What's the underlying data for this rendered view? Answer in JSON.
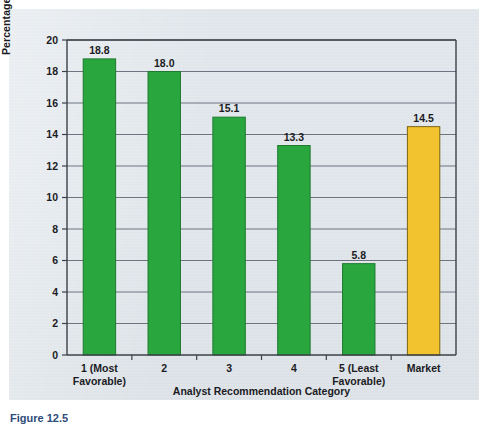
{
  "figure": {
    "caption": "Figure 12.5"
  },
  "chart_data": {
    "type": "bar",
    "title": "",
    "xlabel": "Analyst Recommendation Category",
    "ylabel": "Percentage Return",
    "categories": [
      "1 (Most\nFavorable)",
      "2",
      "3",
      "4",
      "5 (Least\nFavorable)",
      "Market"
    ],
    "category_lines": [
      [
        "1 (Most",
        "Favorable)"
      ],
      [
        "2",
        ""
      ],
      [
        "3",
        ""
      ],
      [
        "4",
        ""
      ],
      [
        "5 (Least",
        "Favorable)"
      ],
      [
        "Market",
        ""
      ]
    ],
    "values": [
      18.8,
      18.0,
      15.1,
      13.3,
      5.8,
      14.5
    ],
    "value_labels": [
      "18.8",
      "18.0",
      "15.1",
      "13.3",
      "5.8",
      "14.5"
    ],
    "bar_colors": [
      "#2aa63f",
      "#2aa63f",
      "#2aa63f",
      "#2aa63f",
      "#2aa63f",
      "#f3c22f"
    ],
    "ylim": [
      0,
      20
    ],
    "yticks": [
      0,
      2,
      4,
      6,
      8,
      10,
      12,
      14,
      16,
      18,
      20
    ],
    "ytick_labels": [
      "0",
      "2",
      "4",
      "6",
      "8",
      "10",
      "12",
      "14",
      "16",
      "18",
      "20"
    ],
    "grid": true,
    "legend": null,
    "colors": {
      "green_bar": "#2aa63f",
      "green_bar_edge": "#1d7a2e",
      "market_bar": "#f3c22f",
      "market_bar_edge": "#7a6413",
      "gridline": "#6d7480",
      "axis": "#3c4048",
      "panel_background": "#dfe5ea",
      "text": "#1b1b1f",
      "caption": "#2e4c7a"
    }
  }
}
